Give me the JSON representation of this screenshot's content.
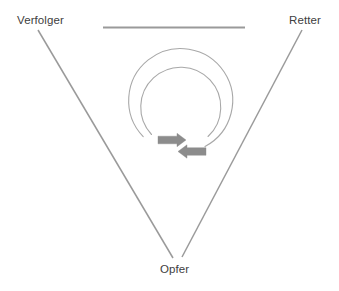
{
  "diagram": {
    "type": "drama-triangle",
    "vertices": [
      {
        "id": "verfolger",
        "label": "Verfolger",
        "position": "top-left"
      },
      {
        "id": "retter",
        "label": "Retter",
        "position": "top-right"
      },
      {
        "id": "opfer",
        "label": "Opfer",
        "position": "bottom"
      }
    ],
    "shapes": {
      "top_edge": {
        "name": "top-horizontal-line",
        "from_x": 103,
        "to_x": 245,
        "y": 27
      },
      "left_edge": {
        "name": "left-diagonal-line",
        "from_x": 38,
        "from_y": 30,
        "to_x": 173,
        "to_y": 258
      },
      "right_edge": {
        "name": "right-diagonal-line",
        "from_x": 302,
        "from_y": 30,
        "to_x": 182,
        "to_y": 257
      },
      "spiral": {
        "name": "center-spiral",
        "center_x": 177,
        "center_y": 101,
        "outer_radius": 52,
        "inner_radius": 40
      },
      "arrows": [
        {
          "name": "clockwise-arrow",
          "direction": "right",
          "x": 158,
          "y": 135,
          "width": 28,
          "height": 10
        },
        {
          "name": "counterclockwise-arrow",
          "direction": "left",
          "x": 178,
          "y": 146,
          "width": 28,
          "height": 10
        }
      ]
    },
    "colors": {
      "line": "#9a9a9a",
      "arrow": "#8c8c8c",
      "text": "#404040",
      "background": "#ffffff"
    }
  }
}
